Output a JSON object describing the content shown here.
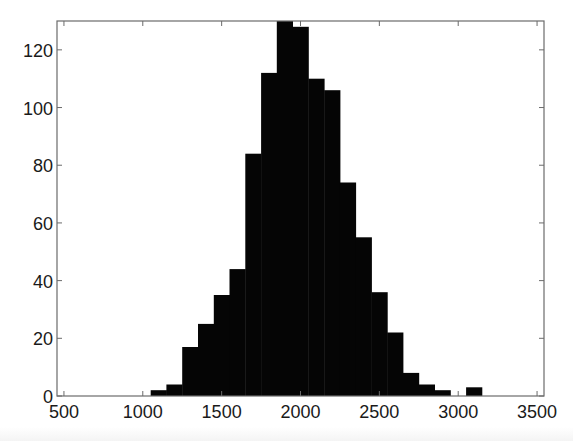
{
  "chart_data": {
    "type": "bar",
    "subtype": "histogram",
    "title": "",
    "xlabel": "",
    "ylabel": "",
    "xlim": [
      456,
      3544
    ],
    "ylim": [
      0,
      130
    ],
    "grid": false,
    "legend": null,
    "bin_width": 100,
    "bin_edges": [
      1050,
      1150,
      1250,
      1350,
      1450,
      1550,
      1650,
      1750,
      1850,
      1950,
      2050,
      2150,
      2250,
      2350,
      2450,
      2550,
      2650,
      2750,
      2850,
      2950,
      3050,
      3150
    ],
    "categories": [
      "1100",
      "1200",
      "1300",
      "1400",
      "1500",
      "1600",
      "1700",
      "1800",
      "1900",
      "2000",
      "2100",
      "2200",
      "2300",
      "2400",
      "2500",
      "2600",
      "2700",
      "2800",
      "2900",
      "3000",
      "3100"
    ],
    "values": [
      2,
      4,
      17,
      25,
      35,
      44,
      84,
      112,
      130,
      128,
      110,
      106,
      74,
      55,
      36,
      22,
      8,
      4,
      2,
      0,
      3
    ],
    "xticks": [
      500,
      1000,
      1500,
      2000,
      2500,
      3000,
      3500
    ],
    "xtick_labels": [
      "500",
      "1000",
      "1500",
      "2000",
      "2500",
      "3000",
      "3500"
    ],
    "yticks": [
      0,
      20,
      40,
      60,
      80,
      100,
      120
    ],
    "ytick_labels": [
      "0",
      "20",
      "40",
      "60",
      "80",
      "100",
      "120"
    ],
    "bar_color": "#050505",
    "frame_color": "#6b6b6b"
  }
}
